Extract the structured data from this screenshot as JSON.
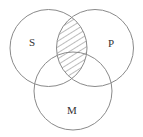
{
  "diagram": {
    "type": "venn-3",
    "colors": {
      "background": "#ffffff",
      "circle_stroke": "#8a8a8a",
      "hatch": "#6a6a6a",
      "label": "#333333"
    },
    "sets": [
      {
        "id": "S",
        "label": "S",
        "cx": 48.5,
        "cy": 48,
        "r": 38.5,
        "label_x": 32,
        "label_y": 42
      },
      {
        "id": "P",
        "label": "P",
        "cx": 95,
        "cy": 48,
        "r": 38.5,
        "label_x": 111,
        "label_y": 43
      },
      {
        "id": "M",
        "label": "M",
        "cx": 73,
        "cy": 91,
        "r": 39,
        "label_x": 72,
        "label_y": 110
      }
    ],
    "shaded_region": {
      "description": "S ∩ P",
      "sets": [
        "S",
        "P"
      ],
      "fill_style": "diagonal-hatch"
    }
  }
}
